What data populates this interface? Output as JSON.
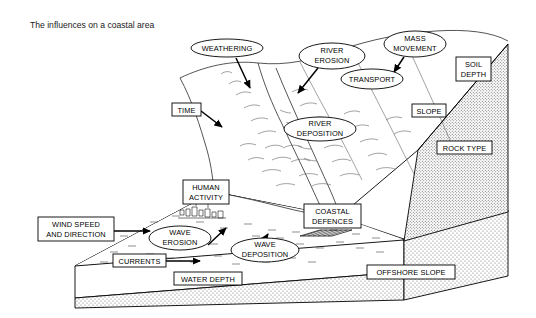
{
  "title": "The influences on a coastal area",
  "diagram": {
    "type": "block-diagram",
    "ellipse_labels": [
      {
        "id": "weathering",
        "text": "WEATHERING",
        "lines": [
          "WEATHERING"
        ],
        "cx": 227,
        "cy": 48,
        "rx": 36,
        "ry": 9
      },
      {
        "id": "river-erosion",
        "text": "RIVER EROSION",
        "lines": [
          "RIVER",
          "EROSION"
        ],
        "cx": 332,
        "cy": 56,
        "rx": 33,
        "ry": 13
      },
      {
        "id": "mass-movement",
        "text": "MASS MOVEMENT",
        "lines": [
          "MASS",
          "MOVEMENT"
        ],
        "cx": 415,
        "cy": 44,
        "rx": 31,
        "ry": 13
      },
      {
        "id": "transport",
        "text": "TRANSPORT",
        "lines": [
          "TRANSPORT"
        ],
        "cx": 372,
        "cy": 79,
        "rx": 31,
        "ry": 10
      },
      {
        "id": "river-deposition",
        "text": "RIVER DEPOSITION",
        "lines": [
          "RIVER",
          "DEPOSITION"
        ],
        "cx": 320,
        "cy": 129,
        "rx": 36,
        "ry": 12
      },
      {
        "id": "wave-erosion",
        "text": "WAVE EROSION",
        "lines": [
          "WAVE",
          "EROSION"
        ],
        "cx": 180,
        "cy": 238,
        "rx": 31,
        "ry": 12
      },
      {
        "id": "wave-deposition",
        "text": "WAVE DEPOSITION",
        "lines": [
          "WAVE",
          "DEPOSITION"
        ],
        "cx": 265,
        "cy": 250,
        "rx": 34,
        "ry": 12
      }
    ],
    "box_labels": [
      {
        "id": "time",
        "text": "TIME",
        "lines": [
          "TIME"
        ],
        "x": 172,
        "y": 103,
        "w": 29,
        "h": 13
      },
      {
        "id": "soil-depth",
        "text": "SOIL DEPTH",
        "lines": [
          "SOIL",
          "DEPTH"
        ],
        "x": 456,
        "y": 57,
        "w": 35,
        "h": 24
      },
      {
        "id": "slope",
        "text": "SLOPE",
        "lines": [
          "SLOPE"
        ],
        "x": 412,
        "y": 104,
        "w": 34,
        "h": 13
      },
      {
        "id": "rock-type",
        "text": "ROCK TYPE",
        "lines": [
          "ROCK TYPE"
        ],
        "x": 437,
        "y": 141,
        "w": 55,
        "h": 13
      },
      {
        "id": "human-activity",
        "text": "HUMAN ACTIVITY",
        "lines": [
          "HUMAN",
          "ACTIVITY"
        ],
        "x": 183,
        "y": 180,
        "w": 46,
        "h": 24
      },
      {
        "id": "wind-speed-and-direction",
        "text": "WIND SPEED AND DIRECTION",
        "lines": [
          "WIND SPEED",
          "AND DIRECTION"
        ],
        "x": 38,
        "y": 217,
        "w": 76,
        "h": 24
      },
      {
        "id": "coastal-defences",
        "text": "COASTAL DEFENCES",
        "lines": [
          "COASTAL",
          "DEFENCES"
        ],
        "x": 304,
        "y": 204,
        "w": 57,
        "h": 24
      },
      {
        "id": "currents",
        "text": "CURRENTS",
        "lines": [
          "CURRENTS"
        ],
        "x": 113,
        "y": 254,
        "w": 53,
        "h": 13
      },
      {
        "id": "water-depth",
        "text": "WATER DEPTH",
        "lines": [
          "WATER DEPTH"
        ],
        "x": 174,
        "y": 272,
        "w": 68,
        "h": 13
      },
      {
        "id": "offshore-slope",
        "text": "OFFSHORE SLOPE",
        "lines": [
          "OFFSHORE SLOPE"
        ],
        "x": 367,
        "y": 265,
        "w": 88,
        "h": 14
      }
    ],
    "colors": {
      "ink": "#000000",
      "paper": "#ffffff",
      "contour": "#555555",
      "stipple": "#6b6b6b"
    }
  }
}
